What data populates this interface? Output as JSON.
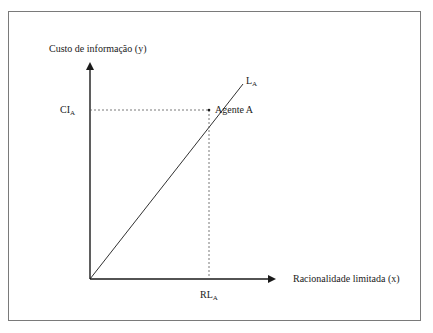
{
  "diagram": {
    "y_axis_label": "Custo de informação (y)",
    "x_axis_label": "Racionalidade limitada (x)",
    "line_label": {
      "base": "L",
      "sub": "A"
    },
    "point_label": "Agente A",
    "y_tick_label": {
      "base": "CI",
      "sub": "A"
    },
    "x_tick_label": {
      "base": "RL",
      "sub": "A"
    },
    "colors": {
      "stroke": "#1a1a1a",
      "frame": "#7a7a7a",
      "dash": "#555555"
    }
  }
}
